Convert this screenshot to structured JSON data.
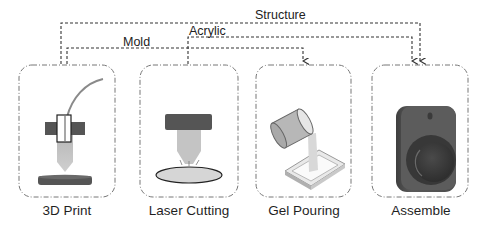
{
  "diagram": {
    "type": "process-flow",
    "steps": [
      {
        "id": "3d-print",
        "label": "3D Print"
      },
      {
        "id": "laser-cutting",
        "label": "Laser Cutting"
      },
      {
        "id": "gel-pouring",
        "label": "Gel Pouring"
      },
      {
        "id": "assemble",
        "label": "Assemble"
      }
    ],
    "connections": [
      {
        "label": "Structure",
        "from": "3D Print",
        "to": "Assemble"
      },
      {
        "label": "Acrylic",
        "from": "Laser Cutting",
        "to": "Assemble"
      },
      {
        "label": "Mold",
        "from": "3D Print",
        "to": "Gel Pouring"
      }
    ]
  },
  "colors": {
    "line": "#333333",
    "box_border": "#777777",
    "dark_block": "#555555",
    "light_gray": "#b5b5b5",
    "filament": "#8a8a8a"
  }
}
